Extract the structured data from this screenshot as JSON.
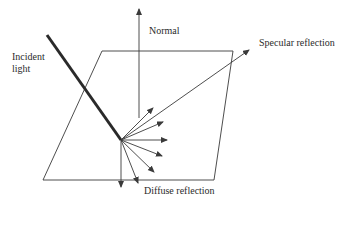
{
  "diagram": {
    "labels": {
      "incident_line1": "Incident",
      "incident_line2": "light",
      "normal": "Normal",
      "specular": "Specular reflection",
      "diffuse": "Diffuse reflection"
    },
    "colors": {
      "stroke": "#3a3a3a",
      "text": "#2b2b2b",
      "background": "#ffffff"
    },
    "geometry": {
      "origin": [
        121,
        140
      ],
      "surface": [
        [
          102,
          51
        ],
        [
          233,
          51
        ],
        [
          214,
          180
        ],
        [
          43,
          180
        ]
      ],
      "incident_start": [
        47,
        35
      ],
      "normal_top": [
        139,
        8
      ],
      "normal_bottom": [
        139,
        118
      ],
      "specular_end": [
        250,
        49
      ],
      "diffuse_ends": [
        [
          155,
          107
        ],
        [
          163,
          122
        ],
        [
          168,
          140
        ],
        [
          162,
          155
        ],
        [
          155,
          172
        ],
        [
          139,
          184
        ],
        [
          121,
          188
        ]
      ]
    }
  }
}
